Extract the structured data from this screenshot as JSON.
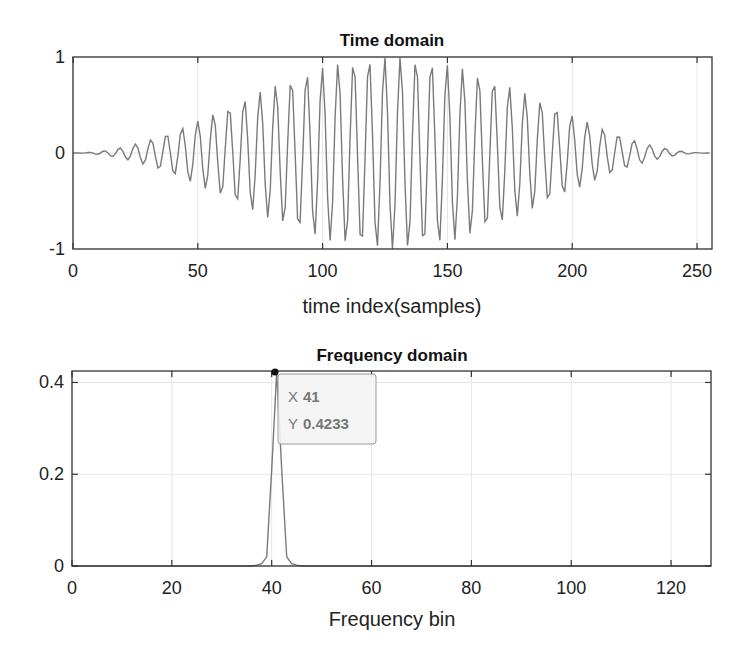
{
  "figure": {
    "top": {
      "title": "Time domain",
      "xlabel": "time index(samples)",
      "xticks": [
        "0",
        "50",
        "100",
        "150",
        "200",
        "250"
      ],
      "yticks": [
        "-1",
        "0",
        "1"
      ]
    },
    "bottom": {
      "title": "Frequency domain",
      "xlabel": "Frequency bin",
      "xticks": [
        "0",
        "20",
        "40",
        "60",
        "80",
        "100",
        "120"
      ],
      "yticks": [
        "0",
        "0.2",
        "0.4"
      ],
      "datatip": {
        "x_key": "X",
        "x_val": "41",
        "y_key": "Y",
        "y_val": "0.4233"
      }
    }
  },
  "chart_data": [
    {
      "type": "line",
      "title": "Time domain",
      "xlabel": "time index(samples)",
      "ylabel": "",
      "xlim": [
        0,
        256
      ],
      "ylim": [
        -1,
        1
      ],
      "grid": true,
      "description": "Sinusoid at frequency bin 41 (of 256) modulated by a Hann-like window; amplitude envelope rises from 0 at n=0 to ~1 at n≈128 and back to 0 at n=255",
      "series": [
        {
          "name": "x[n]",
          "frequency_cycles_per_256": 41,
          "envelope": "hann",
          "n_samples": 256
        }
      ]
    },
    {
      "type": "line",
      "title": "Frequency domain",
      "xlabel": "Frequency bin",
      "ylabel": "",
      "xlim": [
        0,
        128
      ],
      "ylim": [
        0,
        0.4233
      ],
      "grid": true,
      "x": [
        36,
        37,
        38,
        39,
        40,
        41,
        42,
        43,
        44,
        45,
        46
      ],
      "series": [
        {
          "name": "|X[k]|",
          "values": [
            0.0,
            0.002,
            0.005,
            0.02,
            0.21,
            0.4233,
            0.21,
            0.02,
            0.005,
            0.002,
            0.0
          ]
        }
      ],
      "annotations": [
        {
          "type": "datatip",
          "x": 41,
          "y": 0.4233,
          "text": "X 41 / Y 0.4233"
        }
      ]
    }
  ]
}
